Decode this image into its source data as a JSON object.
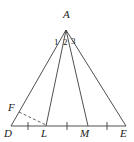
{
  "figure": {
    "background_color": "#ffffff",
    "stroke_color": "#3c3c3c",
    "label_color": "#1a1a1a",
    "width": 134,
    "height": 142
  },
  "points": {
    "A": {
      "label": "A",
      "x": 66,
      "y": 30,
      "label_x": 63,
      "label_y": 9
    },
    "D": {
      "label": "D",
      "x": 11,
      "y": 126,
      "label_x": 6,
      "label_y": 128
    },
    "L": {
      "label": "L",
      "x": 46,
      "y": 126,
      "label_x": 41,
      "label_y": 128
    },
    "M": {
      "label": "M",
      "x": 88,
      "y": 126,
      "label_x": 81,
      "label_y": 128
    },
    "E": {
      "label": "E",
      "x": 126,
      "y": 126,
      "label_x": 121,
      "label_y": 128
    },
    "F": {
      "label": "F",
      "x": 19,
      "y": 112,
      "label_x": 9,
      "label_y": 103
    }
  },
  "segments": [
    {
      "name": "side-AD",
      "from": "A",
      "to": "D",
      "style": "solid"
    },
    {
      "name": "cevian-AL",
      "from": "A",
      "to": "L",
      "style": "solid"
    },
    {
      "name": "cevian-AM",
      "from": "A",
      "to": "M",
      "style": "solid"
    },
    {
      "name": "side-AE",
      "from": "A",
      "to": "E",
      "style": "solid"
    },
    {
      "name": "base-DE",
      "from": "D",
      "to": "E",
      "style": "solid"
    },
    {
      "name": "dashed-FL",
      "from": "F",
      "to": "L",
      "style": "dashed"
    }
  ],
  "tick_marks": [
    {
      "name": "tick-DL-midpoint",
      "x": 28,
      "y": 126
    },
    {
      "name": "tick-LM-midpoint",
      "x": 67,
      "y": 126
    },
    {
      "name": "tick-ME-midpoint",
      "x": 107,
      "y": 126
    }
  ],
  "angle_labels": [
    {
      "name": "angle-1",
      "text": "1",
      "x": 55,
      "y": 40
    },
    {
      "name": "angle-2",
      "text": "2",
      "x": 64,
      "y": 40
    },
    {
      "name": "angle-3",
      "text": "3",
      "x": 72,
      "y": 39
    }
  ]
}
